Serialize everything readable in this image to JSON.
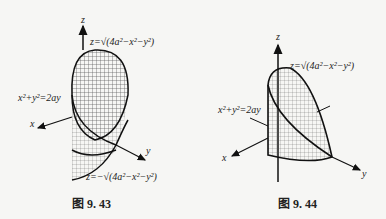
{
  "figures": [
    {
      "caption": "图 9. 43",
      "axes": {
        "x": "x",
        "y": "y",
        "z": "z"
      },
      "labels": {
        "upper_surface": "z=√(4a²−x²−y²)",
        "lower_surface": "z=−√(4a²−x²−y²)",
        "cylinder": "x²+y²=2ay"
      }
    },
    {
      "caption": "图 9. 44",
      "axes": {
        "x": "x",
        "y": "y",
        "z": "z"
      },
      "labels": {
        "upper_surface": "z=√(4a²−x²−y²)",
        "cylinder": "x²+y²=2ay"
      }
    }
  ]
}
